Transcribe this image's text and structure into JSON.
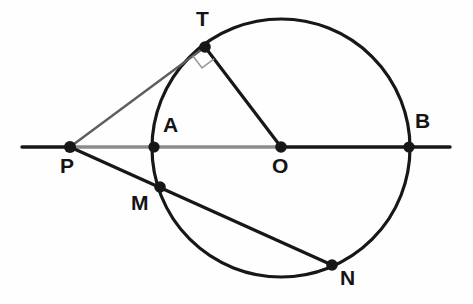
{
  "figure": {
    "width": 473,
    "height": 304,
    "background_color": "#fefefe",
    "stroke_color": "#171717",
    "gray_stroke_color": "#8c8c8c",
    "thin_stroke_color": "#5e5e5e"
  },
  "circle": {
    "name": "main-circle",
    "center_x": 281,
    "center_y": 148,
    "radius": 129,
    "stroke_width": 3.2
  },
  "baseline": {
    "name": "line-AB-extended",
    "x_start": 22,
    "x_end": 450,
    "y": 147,
    "stroke_width": 3.4,
    "gray_from_x": 70,
    "gray_to_x": 281
  },
  "segments": [
    {
      "name": "segment-PT",
      "x1": 70,
      "y1": 147,
      "x2": 205,
      "y2": 47,
      "stroke_width": 2.4,
      "color": "#5e5e5e"
    },
    {
      "name": "segment-TO",
      "x1": 205,
      "y1": 47,
      "x2": 281,
      "y2": 147,
      "stroke_width": 3.2,
      "color": "#171717"
    },
    {
      "name": "segment-PN",
      "x1": 70,
      "y1": 147,
      "x2": 332,
      "y2": 265,
      "stroke_width": 3.2,
      "color": "#171717"
    }
  ],
  "right_angle_mark": {
    "name": "right-angle-marker-at-T",
    "vertex_x": 205,
    "vertex_y": 47,
    "size": 15,
    "stroke_width": 1.6,
    "color": "#9a9a9a"
  },
  "points": [
    {
      "id": "P",
      "label": "P",
      "x": 70,
      "y": 147,
      "dot_r": 6.0,
      "label_x": 60,
      "label_y": 155
    },
    {
      "id": "A",
      "label": "A",
      "x": 154,
      "y": 147,
      "dot_r": 5.6,
      "label_x": 163,
      "label_y": 114
    },
    {
      "id": "T",
      "label": "T",
      "x": 205,
      "y": 47,
      "dot_r": 5.8,
      "label_x": 196,
      "label_y": 8
    },
    {
      "id": "O",
      "label": "O",
      "x": 281,
      "y": 147,
      "dot_r": 5.8,
      "label_x": 272,
      "label_y": 155
    },
    {
      "id": "B",
      "label": "B",
      "x": 409,
      "y": 147,
      "dot_r": 5.6,
      "label_x": 415,
      "label_y": 110
    },
    {
      "id": "M",
      "label": "M",
      "x": 160,
      "y": 187,
      "dot_r": 5.8,
      "label_x": 131,
      "label_y": 192
    },
    {
      "id": "N",
      "label": "N",
      "x": 332,
      "y": 265,
      "dot_r": 5.8,
      "label_x": 340,
      "label_y": 267
    }
  ],
  "chart_data": {
    "type": "diagram",
    "subtype": "euclidean-geometry",
    "elements": {
      "circle": {
        "center": "O",
        "center_xy": [
          281,
          148
        ],
        "radius": 129
      },
      "labeled_points": {
        "P": [
          70,
          147
        ],
        "A": [
          154,
          147
        ],
        "T": [
          205,
          47
        ],
        "O": [
          281,
          147
        ],
        "B": [
          409,
          147
        ],
        "M": [
          160,
          187
        ],
        "N": [
          332,
          265
        ]
      },
      "lines": [
        {
          "from": "line-left-end",
          "to": "line-right-end",
          "through": [
            "P",
            "A",
            "O",
            "B"
          ],
          "kind": "secant-through-center"
        },
        {
          "from": "P",
          "to": "T",
          "kind": "tangent"
        },
        {
          "from": "T",
          "to": "O",
          "kind": "radius"
        },
        {
          "from": "P",
          "to": "N",
          "through": [
            "M"
          ],
          "kind": "secant"
        }
      ],
      "right_angles": [
        {
          "at": "T",
          "between": [
            "T-P",
            "T-O"
          ],
          "degrees": 90
        }
      ],
      "on_circle": [
        "A",
        "T",
        "B",
        "M",
        "N"
      ],
      "outside_circle": [
        "P"
      ],
      "center_point": "O"
    }
  }
}
